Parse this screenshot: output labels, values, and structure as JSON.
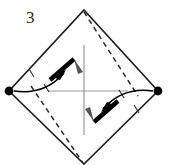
{
  "figure": {
    "step_label": "3",
    "background_color": "#ffffff",
    "canvas": {
      "width": 170,
      "height": 165
    }
  },
  "colors": {
    "outline": "#1a1a1a",
    "dashed_fold": "#2b2b2b",
    "axis_guide": "#999999",
    "vertex_dot": "#000000",
    "arrow": "#000000",
    "label": "#2b2b2b"
  },
  "shape": {
    "name": "diamond-square",
    "vertices": {
      "top": {
        "x": 84,
        "y": 10
      },
      "right": {
        "x": 158,
        "y": 91
      },
      "bottom": {
        "x": 84,
        "y": 164
      },
      "left": {
        "x": 9,
        "y": 91
      }
    },
    "stroke_width": 1.6
  },
  "vertex_markers": [
    {
      "name": "left-vertex-dot",
      "x": 9,
      "y": 91,
      "radius": 4.4
    },
    {
      "name": "right-vertex-dot",
      "x": 158,
      "y": 91,
      "radius": 4.4
    }
  ],
  "axes": {
    "horizontal": {
      "x1": 48,
      "y1": 91,
      "x2": 128,
      "y2": 91
    },
    "vertical": {
      "x1": 84,
      "y1": 45,
      "x2": 84,
      "y2": 135
    },
    "stroke_width": 1.2
  },
  "fold_lines": [
    {
      "name": "upper-right-dashed-fold",
      "x1": 84,
      "y1": 12,
      "x2": 138,
      "y2": 96,
      "dash": "5 4"
    },
    {
      "name": "lower-left-dashed-fold",
      "x1": 31,
      "y1": 86,
      "x2": 83,
      "y2": 163,
      "dash": "5 4"
    }
  ],
  "fold_tabs": [
    {
      "name": "upper-left-fold-tab",
      "path": "M 50 80 L 74 59",
      "width": 4.4
    },
    {
      "name": "lower-right-fold-tab",
      "path": "M 118 101 L 94 122",
      "width": 4.4
    }
  ],
  "arrows": [
    {
      "name": "upper-left-fold-arrow",
      "path": "M 14 91 C 34 93, 50 88, 64 73",
      "head": "M 64 73 L 53 77 L 60 80 Z",
      "direction": "up-right"
    },
    {
      "name": "lower-right-fold-arrow",
      "path": "M 153 91 C 133 89, 117 94, 103 109",
      "head": "M 103 109 L 114 105 L 107 102 Z",
      "direction": "down-left"
    }
  ],
  "tick_marks": [
    {
      "name": "tick-upper-left-outer",
      "x1": 29,
      "y1": 69,
      "x2": 34,
      "y2": 77
    },
    {
      "name": "tick-upper-left-inner",
      "x1": 44,
      "y1": 84,
      "x2": 49,
      "y2": 92
    },
    {
      "name": "tick-lower-right-outer",
      "x1": 139,
      "y1": 113,
      "x2": 134,
      "y2": 105
    },
    {
      "name": "tick-lower-right-inner",
      "x1": 124,
      "y1": 98,
      "x2": 119,
      "y2": 90
    }
  ],
  "step_label_position": {
    "x": 26,
    "y": 23
  }
}
